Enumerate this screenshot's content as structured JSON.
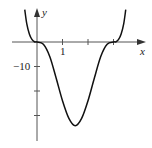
{
  "chart_data": {
    "type": "line",
    "title": "",
    "xlabel": "x",
    "ylabel": "y",
    "x_tick_labels": [
      "1"
    ],
    "x_ticks": [
      1,
      2,
      3
    ],
    "y_tick_labels": [
      "-10"
    ],
    "y_ticks": [
      -10,
      -20,
      -30
    ],
    "xlim": [
      -1,
      4.2
    ],
    "ylim": [
      -40,
      17
    ],
    "grid": false,
    "series": [
      {
        "name": "f(x)",
        "x": [
          -0.48,
          -0.4,
          -0.3,
          -0.2,
          -0.1,
          0,
          0.25,
          0.5,
          0.75,
          1.0,
          1.25,
          1.5,
          1.75,
          2.0,
          2.25,
          2.5,
          2.75,
          3.0,
          3.1,
          3.2,
          3.3,
          3.4,
          3.48
        ],
        "values": [
          13.2,
          7.4,
          3.3,
          1.1,
          0.1,
          0,
          -0.9,
          -5.9,
          -14.7,
          -24.0,
          -31.2,
          -34.2,
          -31.2,
          -24.0,
          -14.7,
          -5.9,
          -0.9,
          0,
          0.1,
          1.1,
          3.3,
          7.4,
          13.2
        ]
      }
    ]
  },
  "labels": {
    "x_axis": "x",
    "y_axis": "y",
    "tick_1": "1",
    "tick_neg10": "−10"
  },
  "colors": {
    "curve": "#111111",
    "axis": "#555555"
  }
}
